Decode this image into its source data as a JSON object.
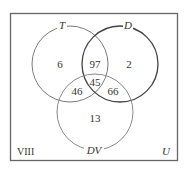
{
  "diagram": {
    "type": "venn-3-set",
    "figure_label": "VIII",
    "universe_label": "U",
    "sets": [
      {
        "name": "T",
        "color": "#7a7a7a"
      },
      {
        "name": "D",
        "color": "#555555"
      },
      {
        "name": "DV",
        "color": "#8a8a8a"
      }
    ],
    "regions": {
      "T_only": "6",
      "D_only": "2",
      "DV_only": "13",
      "T_and_D_only": "97",
      "T_and_DV_only": "46",
      "D_and_DV_only": "66",
      "T_and_D_and_DV": "45"
    }
  }
}
